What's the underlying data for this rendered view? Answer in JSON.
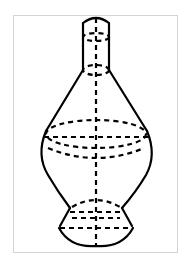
{
  "figure": {
    "colors": {
      "frame": "#d4d4d4",
      "stroke": "#000000",
      "background": "#ffffff"
    },
    "parts": [
      "neck-cylinder",
      "cone-shoulder",
      "spherical-body",
      "base-frustum",
      "axis"
    ]
  }
}
